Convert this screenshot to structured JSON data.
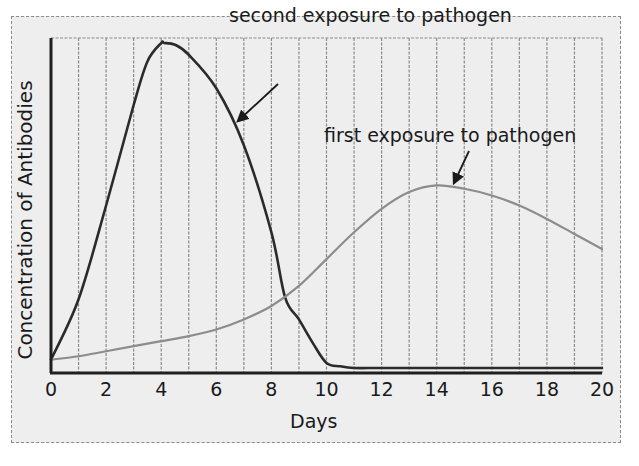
{
  "chart_data": {
    "type": "line",
    "title": "",
    "xlabel": "Days",
    "ylabel": "Concentration of Antibodies",
    "xlim": [
      0,
      20
    ],
    "ylim": [
      0,
      100
    ],
    "y_units": "relative (no numeric ticks shown)",
    "x_ticks": [
      0,
      2,
      4,
      6,
      8,
      10,
      12,
      14,
      16,
      18,
      20
    ],
    "x_tick_labels": [
      "0",
      "2",
      "4",
      "6",
      "8",
      "10",
      "12",
      "14",
      "16",
      "18",
      "20"
    ],
    "grid": {
      "vertical": true,
      "horizontal": false,
      "vertical_interval_days": 1
    },
    "legend": null,
    "series": [
      {
        "name": "second exposure to pathogen",
        "color": "#2b2b2b",
        "x": [
          0,
          1,
          2,
          3,
          3.5,
          4,
          4.1,
          4.5,
          5,
          6,
          7,
          8,
          8.5,
          9,
          9.5,
          10,
          10.5,
          11,
          12,
          14,
          16,
          18,
          20
        ],
        "values": [
          4,
          22,
          50,
          80,
          93,
          98.5,
          98.5,
          98,
          95,
          85,
          68,
          42,
          22.5,
          16,
          9,
          3,
          2,
          1.5,
          1.5,
          1.5,
          1.5,
          1.5,
          1.5
        ]
      },
      {
        "name": "first exposure to pathogen",
        "color": "#8c8c8c",
        "x": [
          0,
          1,
          2,
          3,
          4,
          5,
          6,
          7,
          8,
          9,
          10,
          11,
          12,
          13,
          14,
          15,
          16,
          17,
          18,
          19,
          20
        ],
        "values": [
          4,
          5,
          6.5,
          8,
          9.5,
          11,
          13,
          16,
          20,
          26,
          34,
          42,
          49,
          54,
          56,
          55,
          53,
          50,
          46,
          41.5,
          37
        ]
      }
    ],
    "annotations": [
      {
        "text": "second exposure to pathogen",
        "points_to_series": "second exposure to pathogen",
        "arrow_target_x": 6.6
      },
      {
        "text": "first exposure to pathogen",
        "points_to_series": "first exposure to pathogen",
        "arrow_target_x": 14.5
      }
    ]
  },
  "labels": {
    "ylabel": "Concentration of Antibodies",
    "xlabel": "Days",
    "annotation_second": "second exposure to pathogen",
    "annotation_first": "first exposure to pathogen",
    "ticks": [
      "0",
      "2",
      "4",
      "6",
      "8",
      "10",
      "12",
      "14",
      "16",
      "18",
      "20"
    ]
  },
  "colors": {
    "background": "#eeeeee",
    "axis": "#1f1f1f",
    "gridline": "#8a8a8a",
    "second_exposure": "#2b2b2b",
    "first_exposure": "#8c8c8c"
  }
}
